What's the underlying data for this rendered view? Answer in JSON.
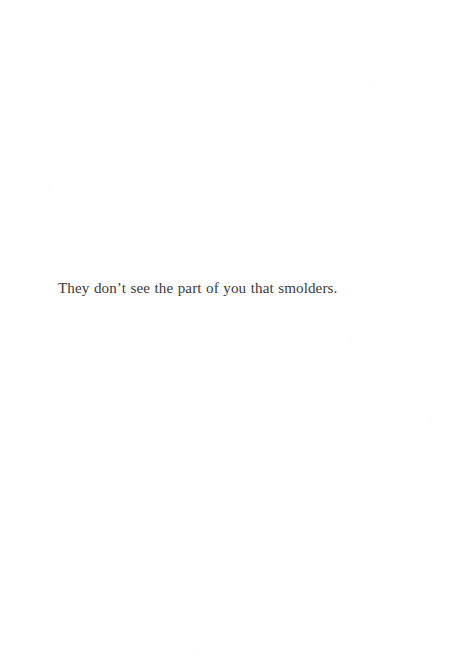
{
  "page": {
    "kind": "book-page",
    "background_color": "#ffffff",
    "width_px": 458,
    "height_px": 664
  },
  "content": {
    "body_text": "They don’t see the part of you that smolders.",
    "text_color": "#3a3a3a",
    "alignment": "left",
    "baseline_y_px": 297,
    "text_left_px": 58,
    "text_right_px": 372,
    "font_size_px": 15
  },
  "grain": {
    "specks": [
      {
        "x": 373,
        "y": 82,
        "size": 2
      },
      {
        "x": 48,
        "y": 185,
        "size": 2
      },
      {
        "x": 350,
        "y": 340,
        "size": 2
      },
      {
        "x": 430,
        "y": 420,
        "size": 2
      },
      {
        "x": 28,
        "y": 655,
        "size": 2
      },
      {
        "x": 196,
        "y": 650,
        "size": 2
      }
    ]
  }
}
